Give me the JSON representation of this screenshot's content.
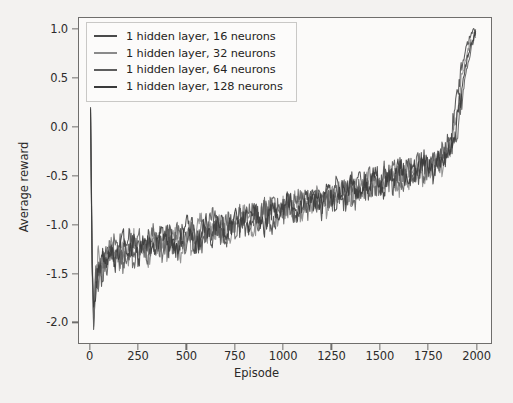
{
  "chart_data": {
    "type": "line",
    "title": "",
    "xlabel": "Episode",
    "ylabel": "Average reward",
    "xlim": [
      -60,
      2080
    ],
    "ylim": [
      -2.22,
      1.12
    ],
    "xticks": [
      0,
      250,
      500,
      750,
      1000,
      1250,
      1500,
      1750,
      2000
    ],
    "xticklabels": [
      "0",
      "250",
      "500",
      "750",
      "1000",
      "1250",
      "1500",
      "1750",
      "2000"
    ],
    "yticks": [
      1.0,
      0.5,
      0.0,
      -0.5,
      -1.0,
      -1.5,
      -2.0
    ],
    "yticklabels": [
      "1.0",
      "0.5",
      "0.0",
      "-0.5",
      "-1.0",
      "-1.5",
      "-2.0"
    ],
    "grid": false,
    "legend_position": "upper left",
    "legend_labels": [
      "1 hidden layer, 16 neurons",
      "1 hidden layer, 32 neurons",
      "1 hidden layer, 64 neurons",
      "1 hidden layer, 128 neurons"
    ],
    "series": [
      {
        "name": "1 hidden layer, 16 neurons",
        "color": "#4a4a4a",
        "x": [
          0,
          8,
          16,
          25,
          40,
          60,
          80,
          100,
          125,
          150,
          175,
          200,
          225,
          250,
          275,
          300,
          325,
          350,
          375,
          400,
          425,
          450,
          475,
          500,
          525,
          550,
          575,
          600,
          625,
          650,
          675,
          700,
          725,
          750,
          775,
          800,
          825,
          850,
          875,
          900,
          925,
          950,
          975,
          1000,
          1025,
          1050,
          1075,
          1100,
          1125,
          1150,
          1175,
          1200,
          1225,
          1250,
          1275,
          1300,
          1325,
          1350,
          1375,
          1400,
          1425,
          1450,
          1475,
          1500,
          1525,
          1550,
          1575,
          1600,
          1625,
          1650,
          1675,
          1700,
          1725,
          1750,
          1775,
          1800,
          1825,
          1850,
          1875,
          1900,
          1925,
          1950,
          1975,
          2000
        ],
        "y": [
          0.18,
          -1.35,
          -2.08,
          -1.6,
          -1.42,
          -1.55,
          -1.3,
          -1.22,
          -1.38,
          -1.18,
          -1.3,
          -1.12,
          -1.28,
          -1.2,
          -1.32,
          -1.15,
          -1.26,
          -1.1,
          -1.22,
          -1.05,
          -1.18,
          -1.28,
          -1.08,
          -1.2,
          -1.02,
          -1.15,
          -1.25,
          -1.05,
          -1.12,
          -0.95,
          -1.08,
          -1.18,
          -0.98,
          -1.05,
          -0.88,
          -1.0,
          -1.1,
          -0.92,
          -0.98,
          -0.85,
          -0.95,
          -1.02,
          -0.82,
          -0.9,
          -0.75,
          -0.86,
          -0.95,
          -0.78,
          -0.85,
          -0.7,
          -0.8,
          -0.88,
          -0.68,
          -0.75,
          -0.62,
          -0.72,
          -0.8,
          -0.6,
          -0.68,
          -0.55,
          -0.65,
          -0.72,
          -0.52,
          -0.6,
          -0.45,
          -0.55,
          -0.62,
          -0.44,
          -0.5,
          -0.38,
          -0.48,
          -0.55,
          -0.36,
          -0.42,
          -0.3,
          -0.38,
          -0.28,
          -0.2,
          -0.05,
          0.25,
          0.58,
          0.82,
          0.95,
          1.0
        ]
      },
      {
        "name": "1 hidden layer, 32 neurons",
        "color": "#8a8a8a",
        "x": [
          0,
          8,
          16,
          25,
          40,
          60,
          80,
          100,
          125,
          150,
          175,
          200,
          225,
          250,
          275,
          300,
          325,
          350,
          375,
          400,
          425,
          450,
          475,
          500,
          525,
          550,
          575,
          600,
          625,
          650,
          675,
          700,
          725,
          750,
          775,
          800,
          825,
          850,
          875,
          900,
          925,
          950,
          975,
          1000,
          1025,
          1050,
          1075,
          1100,
          1125,
          1150,
          1175,
          1200,
          1225,
          1250,
          1275,
          1300,
          1325,
          1350,
          1375,
          1400,
          1425,
          1450,
          1475,
          1500,
          1525,
          1550,
          1575,
          1600,
          1625,
          1650,
          1675,
          1700,
          1725,
          1750,
          1775,
          1800,
          1825,
          1850,
          1875,
          1900,
          1925,
          1950,
          1975,
          2000
        ],
        "y": [
          0.1,
          -1.5,
          -1.95,
          -1.72,
          -1.3,
          -1.48,
          -1.38,
          -1.15,
          -1.3,
          -1.42,
          -1.2,
          -1.35,
          -1.15,
          -1.3,
          -1.18,
          -1.38,
          -1.12,
          -1.28,
          -1.15,
          -1.3,
          -1.08,
          -1.2,
          -1.32,
          -1.12,
          -1.25,
          -1.05,
          -0.95,
          -1.18,
          -1.0,
          -1.12,
          -0.92,
          -1.05,
          -1.15,
          -0.95,
          -1.02,
          -0.85,
          -0.95,
          -1.08,
          -0.88,
          -0.95,
          -0.78,
          -0.88,
          -0.98,
          -0.8,
          -0.88,
          -0.72,
          -0.82,
          -0.9,
          -0.72,
          -0.8,
          -0.65,
          -0.75,
          -0.85,
          -0.68,
          -0.75,
          -0.58,
          -0.68,
          -0.78,
          -0.62,
          -0.7,
          -0.5,
          -0.6,
          -0.68,
          -0.55,
          -0.62,
          -0.48,
          -0.56,
          -0.65,
          -0.48,
          -0.55,
          -0.42,
          -0.5,
          -0.58,
          -0.4,
          -0.45,
          -0.32,
          -0.4,
          -0.3,
          -0.15,
          0.12,
          0.45,
          0.72,
          0.88,
          0.92
        ]
      },
      {
        "name": "1 hidden layer, 64 neurons",
        "color": "#5e5e5e",
        "x": [
          0,
          8,
          16,
          25,
          40,
          60,
          80,
          100,
          125,
          150,
          175,
          200,
          225,
          250,
          275,
          300,
          325,
          350,
          375,
          400,
          425,
          450,
          475,
          500,
          525,
          550,
          575,
          600,
          625,
          650,
          675,
          700,
          725,
          750,
          775,
          800,
          825,
          850,
          875,
          900,
          925,
          950,
          975,
          1000,
          1025,
          1050,
          1075,
          1100,
          1125,
          1150,
          1175,
          1200,
          1225,
          1250,
          1275,
          1300,
          1325,
          1350,
          1375,
          1400,
          1425,
          1450,
          1475,
          1500,
          1525,
          1550,
          1575,
          1600,
          1625,
          1650,
          1675,
          1700,
          1725,
          1750,
          1775,
          1800,
          1825,
          1850,
          1875,
          1900,
          1925,
          1950,
          1975,
          2000
        ],
        "y": [
          0.15,
          -1.2,
          -2.05,
          -1.45,
          -1.62,
          -1.35,
          -1.5,
          -1.32,
          -1.15,
          -1.35,
          -1.42,
          -1.22,
          -1.38,
          -1.1,
          -1.25,
          -1.32,
          -1.08,
          -1.2,
          -1.3,
          -1.12,
          -1.25,
          -1.05,
          -1.18,
          -1.28,
          -1.08,
          -1.2,
          -1.02,
          -1.1,
          -0.88,
          -1.02,
          -1.12,
          -0.92,
          -1.0,
          -1.1,
          -0.9,
          -0.98,
          -0.82,
          -0.92,
          -1.0,
          -0.82,
          -0.9,
          -0.75,
          -0.85,
          -0.95,
          -0.78,
          -0.85,
          -0.68,
          -0.78,
          -0.88,
          -0.7,
          -0.78,
          -0.62,
          -0.72,
          -0.8,
          -0.65,
          -0.7,
          -0.55,
          -0.65,
          -0.75,
          -0.58,
          -0.65,
          -0.48,
          -0.58,
          -0.65,
          -0.5,
          -0.58,
          -0.42,
          -0.5,
          -0.6,
          -0.44,
          -0.5,
          -0.35,
          -0.45,
          -0.52,
          -0.35,
          -0.4,
          -0.25,
          -0.34,
          -0.22,
          -0.1,
          0.22,
          0.55,
          0.8,
          0.96
        ]
      },
      {
        "name": "1 hidden layer, 128 neurons",
        "color": "#3a3a3a",
        "x": [
          0,
          8,
          16,
          25,
          40,
          60,
          80,
          100,
          125,
          150,
          175,
          200,
          225,
          250,
          275,
          300,
          325,
          350,
          375,
          400,
          425,
          450,
          475,
          500,
          525,
          550,
          575,
          600,
          625,
          650,
          675,
          700,
          725,
          750,
          775,
          800,
          825,
          850,
          875,
          900,
          925,
          950,
          975,
          1000,
          1025,
          1050,
          1075,
          1100,
          1125,
          1150,
          1175,
          1200,
          1225,
          1250,
          1275,
          1300,
          1325,
          1350,
          1375,
          1400,
          1425,
          1450,
          1475,
          1500,
          1525,
          1550,
          1575,
          1600,
          1625,
          1650,
          1675,
          1700,
          1725,
          1750,
          1775,
          1800,
          1825,
          1850,
          1875,
          1900,
          1925,
          1950,
          1975,
          2000
        ],
        "y": [
          0.2,
          -1.42,
          -1.85,
          -1.68,
          -1.5,
          -1.28,
          -1.42,
          -1.25,
          -1.42,
          -1.28,
          -1.12,
          -1.28,
          -1.2,
          -1.35,
          -1.12,
          -1.22,
          -1.3,
          -1.15,
          -1.08,
          -1.25,
          -1.15,
          -1.3,
          -1.1,
          -1.0,
          -1.15,
          -1.25,
          -1.08,
          -1.0,
          -1.18,
          -1.05,
          -0.95,
          -1.12,
          -1.02,
          -0.92,
          -1.05,
          -0.92,
          -1.02,
          -0.85,
          -0.95,
          -1.05,
          -0.88,
          -0.82,
          -0.95,
          -0.85,
          -0.72,
          -0.82,
          -0.9,
          -0.75,
          -0.68,
          -0.82,
          -0.72,
          -0.8,
          -0.62,
          -0.7,
          -0.78,
          -0.62,
          -0.7,
          -0.52,
          -0.62,
          -0.72,
          -0.55,
          -0.62,
          -0.45,
          -0.55,
          -0.65,
          -0.5,
          -0.55,
          -0.4,
          -0.48,
          -0.58,
          -0.42,
          -0.48,
          -0.32,
          -0.4,
          -0.5,
          -0.32,
          -0.38,
          -0.26,
          -0.18,
          0.02,
          0.35,
          0.65,
          0.85,
          0.98
        ]
      }
    ]
  },
  "axes": {
    "xlabel": "Episode",
    "ylabel": "Average reward"
  }
}
